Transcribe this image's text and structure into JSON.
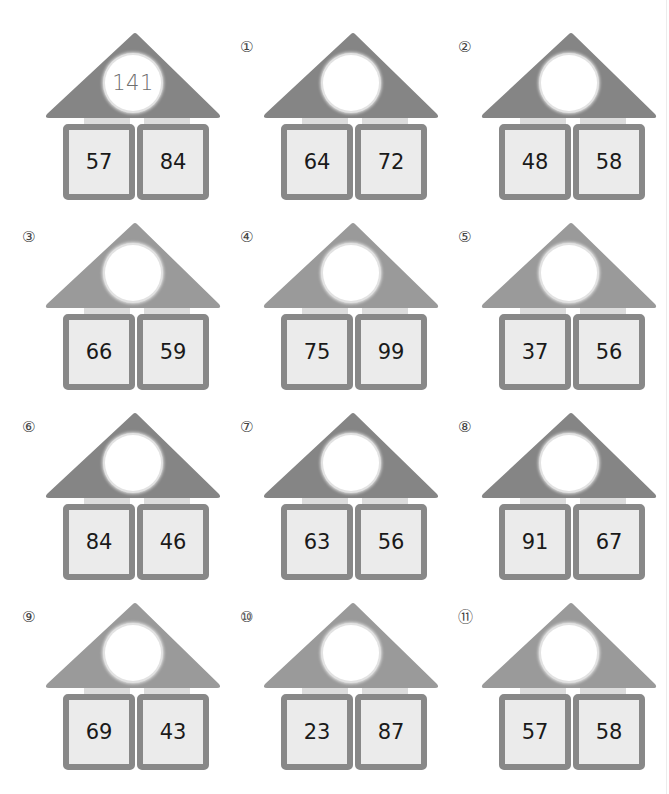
{
  "worksheet": {
    "colors": {
      "roof_dark": "#858585",
      "roof_light": "#9a9a9a",
      "box_border": "#888888",
      "box_fill": "#ebebeb",
      "pillar": "#dcdcdc",
      "circle_fill": "#ffffff",
      "number_text": "#1a1a1a",
      "answer_text": "#6e6e6e"
    },
    "example": {
      "label": "",
      "sum": "141",
      "left": "57",
      "right": "84"
    },
    "problems": [
      {
        "label": "①",
        "sum": "",
        "left": "64",
        "right": "72"
      },
      {
        "label": "②",
        "sum": "",
        "left": "48",
        "right": "58"
      },
      {
        "label": "③",
        "sum": "",
        "left": "66",
        "right": "59"
      },
      {
        "label": "④",
        "sum": "",
        "left": "75",
        "right": "99"
      },
      {
        "label": "⑤",
        "sum": "",
        "left": "37",
        "right": "56"
      },
      {
        "label": "⑥",
        "sum": "",
        "left": "84",
        "right": "46"
      },
      {
        "label": "⑦",
        "sum": "",
        "left": "63",
        "right": "56"
      },
      {
        "label": "⑧",
        "sum": "",
        "left": "91",
        "right": "67"
      },
      {
        "label": "⑨",
        "sum": "",
        "left": "69",
        "right": "43"
      },
      {
        "label": "⑩",
        "sum": "",
        "left": "23",
        "right": "87"
      },
      {
        "label": "⑪",
        "sum": "",
        "left": "57",
        "right": "58"
      }
    ]
  }
}
